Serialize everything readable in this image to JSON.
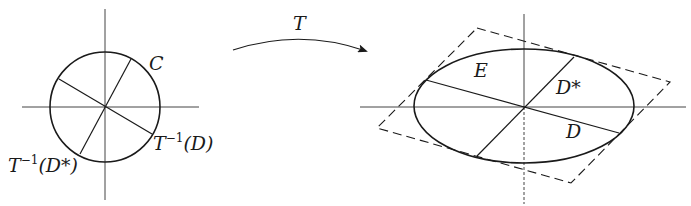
{
  "figure": {
    "colors": {
      "stroke": "#1a1a1a",
      "axis": "#333333",
      "background": "#ffffff"
    },
    "left_panel": {
      "curve_label": "C",
      "diameter_d_label_base": "T",
      "diameter_d_label_sup": "−1",
      "diameter_d_label_arg": "(D)",
      "diameter_dstar_label_base": "T",
      "diameter_dstar_label_sup": "−1",
      "diameter_dstar_label_arg": "(D*)"
    },
    "transform_arrow": {
      "label": "T"
    },
    "right_panel": {
      "curve_label": "E",
      "diameter_d_label": "D",
      "diameter_dstar_label": "D*"
    }
  }
}
